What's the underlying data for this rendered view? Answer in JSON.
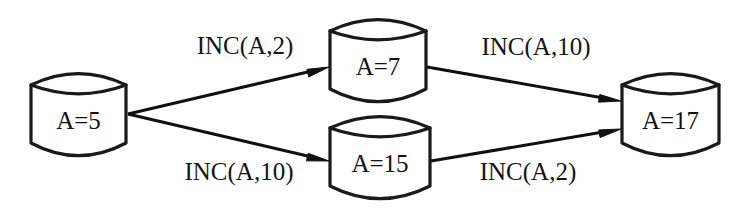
{
  "diagram": {
    "type": "state-transition-graph",
    "background_color": "#ffffff",
    "stroke_color": "#1a1a1a",
    "text_color": "#121212",
    "nodes": [
      {
        "id": "start",
        "label": "A=5",
        "icon": "database-cylinder-icon",
        "x": 31,
        "y": 72,
        "width": 95,
        "height": 84,
        "cap": 13
      },
      {
        "id": "upper",
        "label": "A=7",
        "icon": "database-cylinder-icon",
        "x": 330,
        "y": 18,
        "width": 96,
        "height": 84,
        "cap": 13
      },
      {
        "id": "lower",
        "label": "A=15",
        "icon": "database-cylinder-icon",
        "x": 330,
        "y": 115,
        "width": 100,
        "height": 84,
        "cap": 13
      },
      {
        "id": "end",
        "label": "A=17",
        "icon": "database-cylinder-icon",
        "x": 622,
        "y": 72,
        "width": 97,
        "height": 84,
        "cap": 13
      }
    ],
    "edges": [
      {
        "id": "edge-start-upper",
        "from": "start",
        "to": "upper",
        "label": "INC(A,2)",
        "label_x": 245,
        "label_y": 48,
        "x1": 128,
        "y1": 114,
        "x2": 329,
        "y2": 67
      },
      {
        "id": "edge-start-lower",
        "from": "start",
        "to": "lower",
        "label": "INC(A,10)",
        "label_x": 239,
        "label_y": 174,
        "x1": 128,
        "y1": 114,
        "x2": 329,
        "y2": 161
      },
      {
        "id": "edge-upper-end",
        "from": "upper",
        "to": "end",
        "label": "INC(A,10)",
        "label_x": 536,
        "label_y": 49,
        "x1": 427,
        "y1": 67,
        "x2": 621,
        "y2": 101
      },
      {
        "id": "edge-lower-end",
        "from": "lower",
        "to": "end",
        "label": "INC(A,2)",
        "label_x": 528,
        "label_y": 174,
        "x1": 431,
        "y1": 161,
        "x2": 621,
        "y2": 129
      }
    ]
  }
}
